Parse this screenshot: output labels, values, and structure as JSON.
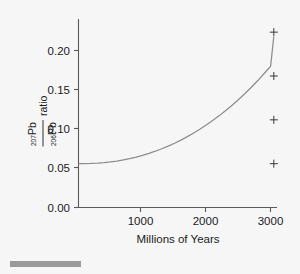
{
  "chart_data": {
    "type": "line",
    "title": "",
    "subtitle": "",
    "xlabel": "Millions of Years",
    "ylabel": "207Pb/206Pb ratio",
    "ylabel_parts": {
      "numerator_sup": "207",
      "numerator_el": "Pb",
      "denominator_sup": "206",
      "denominator_el": "Pb",
      "suffix": "ratio"
    },
    "xlim": [
      0,
      3100
    ],
    "ylim": [
      0.0,
      0.215
    ],
    "grid": false,
    "legend": "none",
    "xticks": [
      1000,
      2000,
      3000
    ],
    "xtick_labels": [
      "1000",
      "2000",
      "3000"
    ],
    "yticks": [
      0.0,
      0.05,
      0.1,
      0.15,
      0.2
    ],
    "ytick_labels": [
      "0.00",
      "0.05",
      "0.10",
      "0.15",
      "0.20"
    ],
    "series": [
      {
        "name": "207Pb/206Pb growth curve",
        "type": "line",
        "color": "#8d8d91",
        "x": [
          0,
          100,
          200,
          300,
          400,
          500,
          600,
          700,
          800,
          900,
          1000,
          1100,
          1200,
          1300,
          1400,
          1500,
          1600,
          1700,
          1800,
          1900,
          2000,
          2100,
          2200,
          2300,
          2400,
          2500,
          2600,
          2700,
          2800,
          2900,
          3000,
          3050
        ],
        "y": [
          0.05,
          0.05,
          0.0502,
          0.0506,
          0.0512,
          0.052,
          0.053,
          0.0543,
          0.0558,
          0.0575,
          0.0595,
          0.0617,
          0.0642,
          0.067,
          0.07,
          0.0733,
          0.0769,
          0.0808,
          0.085,
          0.0895,
          0.0943,
          0.0994,
          0.1048,
          0.1106,
          0.1167,
          0.1232,
          0.13,
          0.1372,
          0.1448,
          0.1528,
          0.1612,
          0.195
        ]
      },
      {
        "name": "measured samples",
        "type": "scatter",
        "marker": "plus",
        "color": "#3a3a3a",
        "x": [
          3050,
          3050,
          3050,
          3050
        ],
        "y": [
          0.2,
          0.15,
          0.1,
          0.05
        ]
      }
    ],
    "colors": {
      "background": "#f6f6f6",
      "axis": "#5a5a5a",
      "curve": "#8d8d91",
      "marker": "#3a3a3a",
      "text": "#1b1b1b",
      "bottom_bar": "#9a9a9a"
    }
  },
  "figure": {
    "bottom_bar_label": ""
  }
}
